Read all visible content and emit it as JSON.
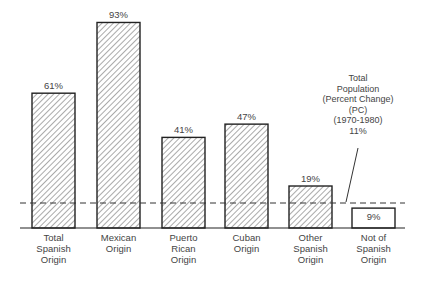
{
  "chart_data": {
    "type": "bar",
    "title": "",
    "xlabel": "",
    "ylabel": "Percent Change (1970-1980)",
    "categories": [
      "Total Spanish Origin",
      "Mexican Origin",
      "Puerto Rican Origin",
      "Cuban Origin",
      "Other Spanish Origin",
      "Not of Spanish Origin"
    ],
    "values": [
      61,
      93,
      41,
      47,
      19,
      9
    ],
    "value_labels": [
      "61%",
      "93%",
      "41%",
      "47%",
      "19%",
      "9%"
    ],
    "fill": [
      "hatched",
      "hatched",
      "hatched",
      "hatched",
      "hatched",
      "white"
    ],
    "reference_line": {
      "value": 11,
      "style": "dashed",
      "label": "Total Population (Percent Change) (PC) (1970-1980) 11%"
    },
    "ylim": [
      0,
      100
    ],
    "grid": false,
    "legend": "none"
  },
  "labels": [
    [
      "Total",
      "Spanish",
      "Origin"
    ],
    [
      "Mexican",
      "Origin"
    ],
    [
      "Puerto",
      "Rican",
      "Origin"
    ],
    [
      "Cuban",
      "Origin"
    ],
    [
      "Other",
      "Spanish",
      "Origin"
    ],
    [
      "Not of",
      "Spanish",
      "Origin"
    ]
  ],
  "annotation": {
    "line1": "Total",
    "line2": "Population",
    "line3": "(Percent Change)",
    "line4": "(PC)",
    "line5": "(1970-1980)",
    "line6": "11%"
  }
}
